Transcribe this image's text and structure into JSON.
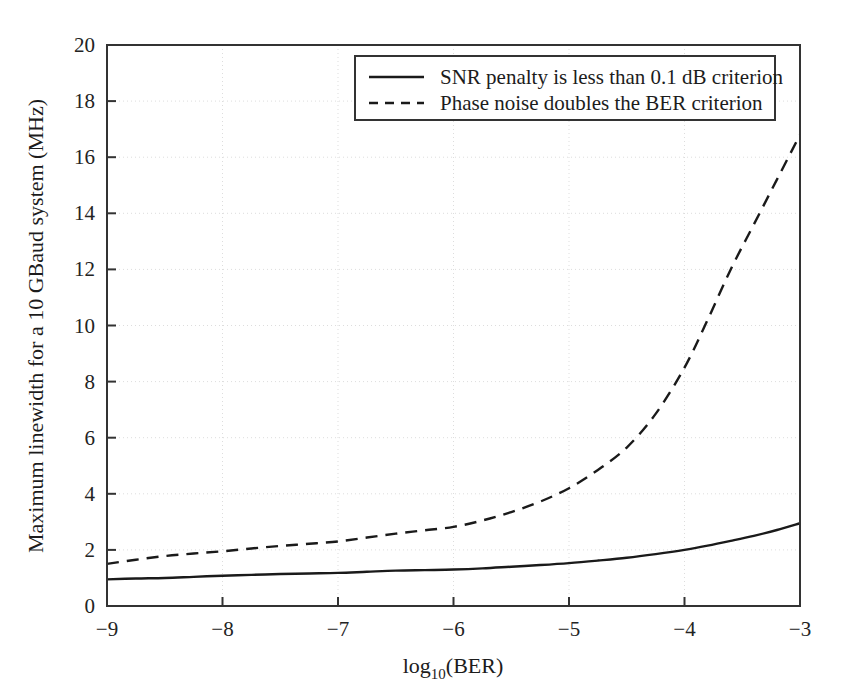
{
  "figure": {
    "background_color": "#ffffff",
    "plot_area": {
      "x0": 107,
      "y0": 45,
      "x1": 800,
      "y1": 606
    },
    "frame_color": "#333333",
    "grid_color": "#dddddd"
  },
  "chart_data": {
    "type": "line",
    "title": "",
    "xlabel": "log10(BER)",
    "xlabel_base": "log",
    "xlabel_sub": "10",
    "xlabel_rest": "(BER)",
    "ylabel": "Maximum linewidth for a 10 GBaud system (MHz)",
    "xlim": [
      -9,
      -3
    ],
    "ylim": [
      0,
      20
    ],
    "xticks": [
      -9,
      -8,
      -7,
      -6,
      -5,
      -4,
      -3
    ],
    "xtick_labels": [
      "−9",
      "−8",
      "−7",
      "−6",
      "−5",
      "−4",
      "−3"
    ],
    "yticks": [
      0,
      2,
      4,
      6,
      8,
      10,
      12,
      14,
      16,
      18,
      20
    ],
    "ytick_labels": [
      "0",
      "2",
      "4",
      "6",
      "8",
      "10",
      "12",
      "14",
      "16",
      "18",
      "20"
    ],
    "grid": true,
    "grid_style": "dotted",
    "legend_position": "upper center",
    "x": [
      -9.0,
      -8.75,
      -8.5,
      -8.25,
      -8.0,
      -7.75,
      -7.5,
      -7.25,
      -7.0,
      -6.75,
      -6.5,
      -6.25,
      -6.0,
      -5.75,
      -5.5,
      -5.25,
      -5.0,
      -4.75,
      -4.5,
      -4.25,
      -4.0,
      -3.8,
      -3.6,
      -3.4,
      -3.2,
      -3.0
    ],
    "series": [
      {
        "name": "SNR penalty is less than 0.1 dB criterion",
        "style": "solid",
        "color": "#1a1a1a",
        "values": [
          0.95,
          0.98,
          1.0,
          1.04,
          1.08,
          1.11,
          1.14,
          1.16,
          1.18,
          1.22,
          1.26,
          1.28,
          1.3,
          1.34,
          1.4,
          1.46,
          1.53,
          1.62,
          1.72,
          1.85,
          2.0,
          2.15,
          2.32,
          2.5,
          2.71,
          2.95
        ]
      },
      {
        "name": "Phase noise doubles the BER criterion",
        "style": "dashed",
        "color": "#1a1a1a",
        "values": [
          1.5,
          1.65,
          1.78,
          1.87,
          1.95,
          2.05,
          2.14,
          2.22,
          2.3,
          2.44,
          2.58,
          2.7,
          2.82,
          3.05,
          3.35,
          3.72,
          4.2,
          4.85,
          5.65,
          6.85,
          8.5,
          10.2,
          12.0,
          13.6,
          15.2,
          16.8
        ]
      }
    ],
    "legend_entries": [
      {
        "label": "SNR penalty is less than 0.1 dB criterion",
        "style": "solid"
      },
      {
        "label": "Phase noise doubles the BER criterion",
        "style": "dashed"
      }
    ]
  }
}
